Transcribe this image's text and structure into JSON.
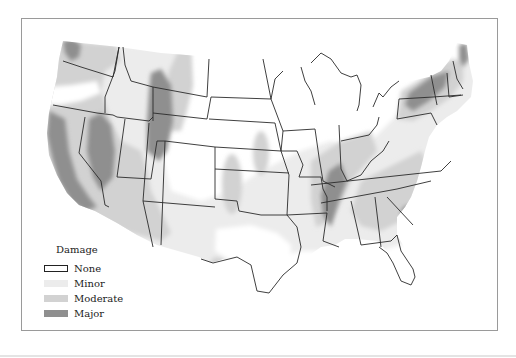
{
  "map": {
    "subject": "Contiguous United States damage map",
    "colors": {
      "none": "#ffffff",
      "minor": "#ececec",
      "moderate": "#d2d2d2",
      "major": "#8f8f8f",
      "border": "#2a2a2a",
      "frame": "#9a9a9a"
    }
  },
  "legend": {
    "title": "Damage",
    "items": [
      {
        "label": "None",
        "color": "#ffffff",
        "outlined": true
      },
      {
        "label": "Minor",
        "color": "#ececec",
        "outlined": false
      },
      {
        "label": "Moderate",
        "color": "#d2d2d2",
        "outlined": false
      },
      {
        "label": "Major",
        "color": "#8f8f8f",
        "outlined": false
      }
    ]
  }
}
